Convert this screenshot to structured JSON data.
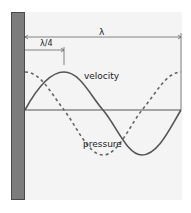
{
  "diagram": {
    "title": "",
    "labels": {
      "wavelength": "λ",
      "quarter_wavelength": "λ/4",
      "velocity": "velocity",
      "pressure": "pressure"
    },
    "elements": {
      "wall": "rigid wall / closed end",
      "axis": "equilibrium line",
      "velocity_curve": "solid sine wave, zero at wall",
      "pressure_curve": "dashed cosine wave, maximum at wall"
    },
    "colors": {
      "wall_fill": "#7c7c7c",
      "wall_edge": "#4a4a4a",
      "curve": "#555555",
      "background_panel": "#f4f4f4",
      "text": "#222222"
    }
  }
}
